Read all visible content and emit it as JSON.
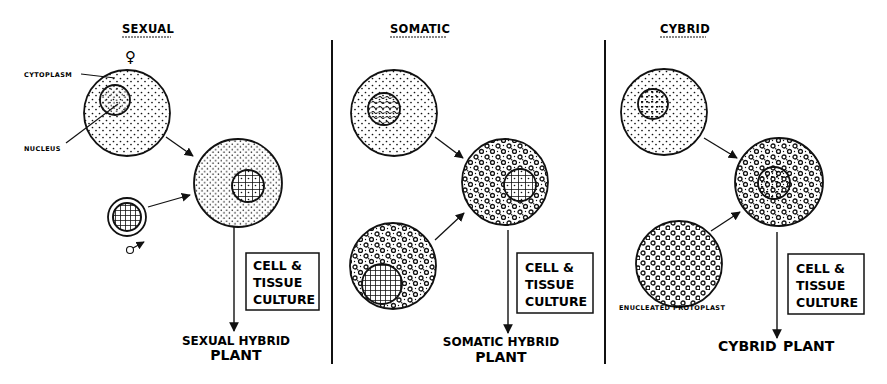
{
  "diagram": {
    "type": "protoplast fusion comparison",
    "panels": [
      {
        "id": "sexual",
        "title": "SEXUAL",
        "labels": {
          "cytoplasm": "CYTOPLASM",
          "nucleus": "NUCLEUS",
          "female_symbol": "♀",
          "male_symbol": "♂"
        },
        "process_box": [
          "CELL &",
          "TISSUE",
          "CULTURE"
        ],
        "result_line1": "SEXUAL HYBRID",
        "result_line2": "PLANT"
      },
      {
        "id": "somatic",
        "title": "SOMATIC",
        "process_box": [
          "CELL &",
          "TISSUE",
          "CULTURE"
        ],
        "result_line1": "SOMATIC HYBRID",
        "result_line2": "PLANT"
      },
      {
        "id": "cybrid",
        "title": "CYBRID",
        "labels": {
          "enucleated": "ENUCLEATED PROTOPLAST"
        },
        "process_box": [
          "CELL &",
          "TISSUE",
          "CULTURE"
        ],
        "result_line1": "CYBRID",
        "result_line2": "PLANT"
      }
    ],
    "colors": {
      "ink": "#111111",
      "background": "#ffffff"
    }
  }
}
